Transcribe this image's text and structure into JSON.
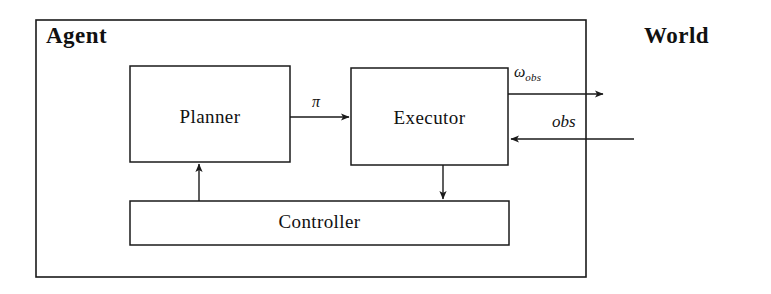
{
  "diagram": {
    "title_agent": "Agent",
    "title_world": "World",
    "background_color": "#ffffff",
    "stroke_color": "#1a1a1a",
    "boxes": [
      {
        "id": "agent",
        "label": "Agent",
        "x": 36,
        "y": 20,
        "w": 550,
        "h": 257
      },
      {
        "id": "planner",
        "label": "Planner",
        "x": 130,
        "y": 66,
        "w": 160,
        "h": 96
      },
      {
        "id": "executor",
        "label": "Executor",
        "x": 351,
        "y": 68,
        "w": 157,
        "h": 97
      },
      {
        "id": "controller",
        "label": "Controller",
        "x": 130,
        "y": 201,
        "w": 379,
        "h": 44
      }
    ],
    "edges": [
      {
        "id": "planner-to-executor",
        "label": "π",
        "from": "planner",
        "to": "executor",
        "direction": "right"
      },
      {
        "id": "executor-to-world",
        "label": "ω",
        "sublabel": "obs",
        "from": "executor",
        "to": "world",
        "direction": "right"
      },
      {
        "id": "world-to-executor",
        "label": "obs",
        "from": "world",
        "to": "executor",
        "direction": "left"
      },
      {
        "id": "executor-to-controller",
        "label": "",
        "from": "executor",
        "to": "controller",
        "direction": "down"
      },
      {
        "id": "controller-to-planner",
        "label": "",
        "from": "controller",
        "to": "planner",
        "direction": "up"
      }
    ],
    "labels": {
      "pi": "π",
      "omega": "ω",
      "omega_subscript": "obs",
      "obs": "obs"
    }
  }
}
